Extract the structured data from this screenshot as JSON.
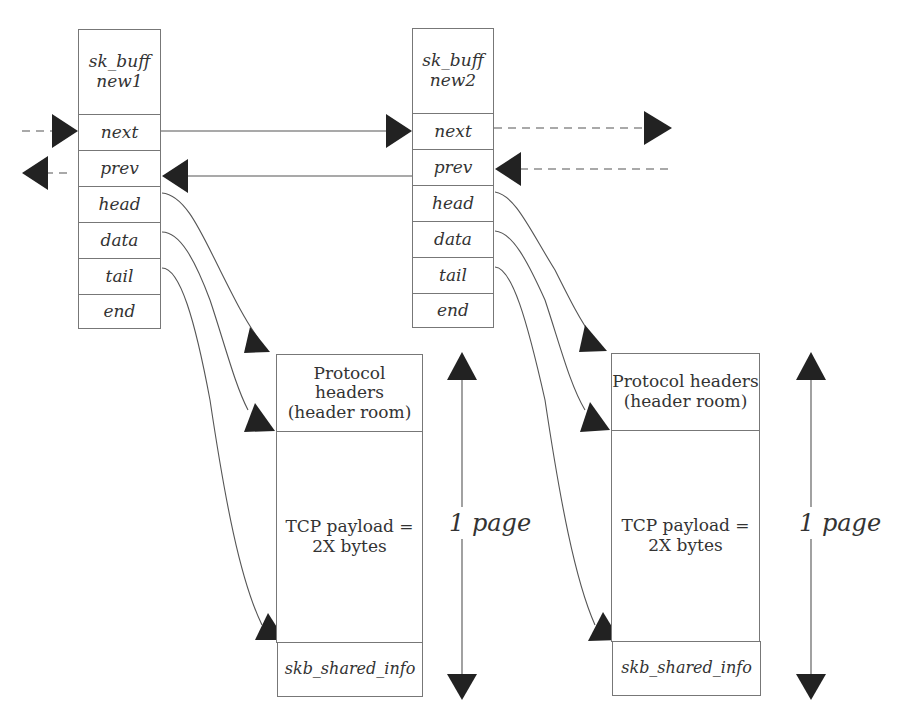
{
  "diagram": {
    "type": "linked-list-memory-layout",
    "sk_buffs": [
      {
        "id": "new1",
        "title": "sk_buff\nnew1",
        "fields": [
          "next",
          "prev",
          "head",
          "data",
          "tail",
          "end"
        ]
      },
      {
        "id": "new2",
        "title": "sk_buff\nnew2",
        "fields": [
          "next",
          "prev",
          "head",
          "data",
          "tail",
          "end"
        ]
      }
    ],
    "buffers": [
      {
        "header_room": "Protocol headers\n(header room)",
        "payload": "TCP payload =\n2X bytes",
        "shared_info": "skb_shared_info",
        "size_label": "1 page"
      },
      {
        "header_room": "Protocol headers\n(header room)",
        "payload": "TCP payload =\n2X bytes",
        "shared_info": "skb_shared_info",
        "size_label": "1 page"
      }
    ],
    "connections": [
      {
        "from": "prev-list",
        "to": "new1.next",
        "style": "dashed"
      },
      {
        "from": "new1.prev",
        "to": "prev-list",
        "style": "dashed"
      },
      {
        "from": "new1.next",
        "to": "new2.next",
        "style": "solid"
      },
      {
        "from": "new2.prev",
        "to": "new1.prev",
        "style": "solid"
      },
      {
        "from": "new2.next",
        "to": "next-list",
        "style": "dashed"
      },
      {
        "from": "next-list",
        "to": "new2.prev",
        "style": "dashed"
      },
      {
        "from": "new1.head",
        "to": "buffer1.start",
        "style": "curve"
      },
      {
        "from": "new1.data",
        "to": "buffer1.payload_start",
        "style": "curve"
      },
      {
        "from": "new1.tail",
        "to": "buffer1.payload_end",
        "style": "curve"
      },
      {
        "from": "new2.head",
        "to": "buffer2.start",
        "style": "curve"
      },
      {
        "from": "new2.data",
        "to": "buffer2.payload_start",
        "style": "curve"
      },
      {
        "from": "new2.tail",
        "to": "buffer2.payload_end",
        "style": "curve"
      }
    ],
    "colors": {
      "line": "#555555",
      "arrowhead": "#222222",
      "border": "#777777",
      "text": "#333333"
    }
  }
}
